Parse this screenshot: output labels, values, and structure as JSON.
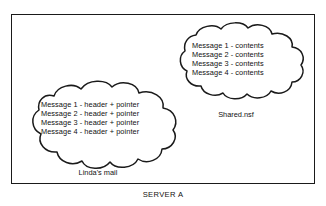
{
  "diagram": {
    "caption": "SERVER A",
    "container_label": "server-boundary",
    "colors": {
      "stroke": "#1a1a1a",
      "background": "#ffffff",
      "text": "#111111"
    },
    "clouds": [
      {
        "id": "shared-nsf",
        "caption": "Shared.nsf",
        "lines": [
          "Message 1 - contents",
          "Message 2 - contents",
          "Message 3 - contents",
          "Message 4 - contents"
        ]
      },
      {
        "id": "lindas-mail",
        "caption": "Linda's mail",
        "lines": [
          "Message 1 - header + pointer",
          "Message 2 - header + pointer",
          "Message 3 - header + pointer",
          "Message 4 - header + pointer"
        ]
      }
    ]
  }
}
